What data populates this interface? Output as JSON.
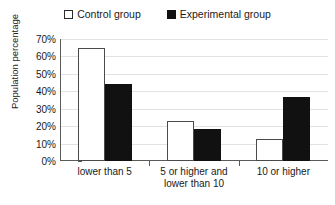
{
  "chart_data": {
    "type": "bar",
    "title": "",
    "xlabel": "",
    "ylabel": "Population percentage",
    "categories": [
      "lower than 5",
      "5 or higher and lower than 10",
      "10 or higher"
    ],
    "category_lines": [
      [
        "lower than 5"
      ],
      [
        "5 or higher and",
        "lower than 10"
      ],
      [
        "10 or higher"
      ]
    ],
    "series": [
      {
        "name": "Control group",
        "values": [
          65,
          23,
          12.5
        ],
        "color": "#ffffff",
        "marker": "open-square"
      },
      {
        "name": "Experimental group",
        "values": [
          44,
          18.5,
          37
        ],
        "color": "#111111",
        "marker": "filled-square"
      }
    ],
    "ylim": [
      0,
      70
    ],
    "ytick_values": [
      0,
      10,
      20,
      30,
      40,
      50,
      60,
      70
    ],
    "ytick_labels": [
      "0%",
      "10%",
      "20%",
      "30%",
      "40%",
      "50%",
      "60%",
      "70%"
    ],
    "grid": true,
    "legend_position": "top-center"
  },
  "legend": {
    "entries": [
      {
        "label": "Control group"
      },
      {
        "label": "Experimental group"
      }
    ]
  },
  "colors": {
    "control_fill": "#ffffff",
    "control_border": "#4a4a4a",
    "experimental_fill": "#111111",
    "axis": "#5a5a5a",
    "gridline": "#e2e2e2",
    "text": "#1a1a1a"
  }
}
